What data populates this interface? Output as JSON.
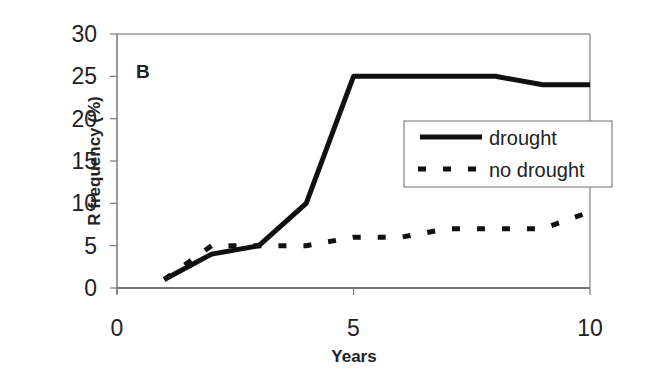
{
  "chart_data": {
    "type": "line",
    "title": "",
    "panel_label": "B",
    "xlabel": "Years",
    "ylabel": "R frequency (%)",
    "xlim": [
      0,
      10
    ],
    "ylim": [
      0,
      30
    ],
    "x_ticks": [
      0,
      5,
      10
    ],
    "y_ticks": [
      0,
      5,
      10,
      15,
      20,
      25,
      30
    ],
    "grid": false,
    "legend_position": "right-center inside plot",
    "x": [
      1,
      2,
      3,
      4,
      5,
      6,
      7,
      8,
      9,
      10
    ],
    "series": [
      {
        "name": "drought",
        "style": "solid",
        "color": "#111111",
        "values": [
          1,
          4,
          5,
          10,
          25,
          25,
          25,
          25,
          24,
          24
        ]
      },
      {
        "name": "no drought",
        "style": "dashed",
        "color": "#111111",
        "values": [
          1,
          5,
          5,
          5,
          6,
          6,
          7,
          7,
          7,
          9
        ]
      }
    ]
  },
  "legend": {
    "items": [
      {
        "label": "drought"
      },
      {
        "label": "no drought"
      }
    ]
  }
}
